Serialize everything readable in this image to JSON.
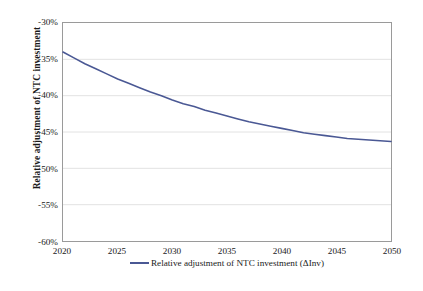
{
  "chart_data": {
    "type": "line",
    "title": "",
    "subtitle": "",
    "xlabel": "",
    "ylabel": "Relative adjustment of NTC investment",
    "xlim": [
      2020,
      2050
    ],
    "ylim": [
      -60,
      -30
    ],
    "grid": true,
    "legend_position": "bottom",
    "x_tick_labels": [
      "2020",
      "2025",
      "2030",
      "2035",
      "2040",
      "2045",
      "2050"
    ],
    "x_ticks": [
      2020,
      2025,
      2030,
      2035,
      2040,
      2045,
      2050
    ],
    "y_tick_labels": [
      "-30%",
      "-35%",
      "-40%",
      "-45%",
      "-50%",
      "-55%",
      "-60%"
    ],
    "y_ticks": [
      -30,
      -35,
      -40,
      -45,
      -50,
      -55,
      -60
    ],
    "series": [
      {
        "name": "Relative adjustment of NTC investment (ΔInv)",
        "color": "#4a5894",
        "x": [
          2020,
          2021,
          2022,
          2023,
          2024,
          2025,
          2026,
          2027,
          2028,
          2029,
          2030,
          2031,
          2032,
          2033,
          2034,
          2035,
          2036,
          2037,
          2038,
          2039,
          2040,
          2041,
          2042,
          2043,
          2044,
          2045,
          2046,
          2047,
          2048,
          2049,
          2050
        ],
        "values": [
          -34.0,
          -34.8,
          -35.6,
          -36.3,
          -37.0,
          -37.7,
          -38.3,
          -38.9,
          -39.5,
          -40.0,
          -40.6,
          -41.1,
          -41.5,
          -42.0,
          -42.4,
          -42.8,
          -43.2,
          -43.6,
          -43.9,
          -44.2,
          -44.5,
          -44.8,
          -45.1,
          -45.3,
          -45.5,
          -45.7,
          -45.9,
          -46.0,
          -46.1,
          -46.2,
          -46.3
        ]
      }
    ]
  },
  "axes": {
    "y_title": "Relative adjustment of NTC investment"
  },
  "legend": {
    "items": [
      {
        "label": "Relative adjustment of NTC investment (ΔInv)",
        "color": "#4a5894"
      }
    ]
  },
  "colors": {
    "series": "#4a5894",
    "grid": "#e2e2e2",
    "frame": "#9a9a9a",
    "text": "#1a1a1a",
    "background": "#ffffff"
  }
}
